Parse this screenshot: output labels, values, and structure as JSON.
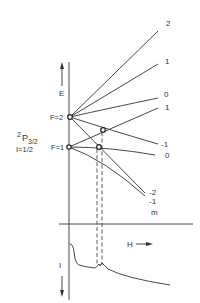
{
  "diagram": {
    "energy_axis_label": "E",
    "field_axis_label": "H",
    "intensity_axis_label": "I",
    "state_label_main": "2",
    "state_label_P": "P",
    "state_label_sub": "3/2",
    "nuclear_spin_label": "I=1/2",
    "levels": [
      {
        "label": "F=2",
        "id": "F2"
      },
      {
        "label": "F=1",
        "id": "F1"
      }
    ],
    "branch_labels": [
      "2",
      "1",
      "0",
      "1",
      "-1",
      "0",
      "-2",
      "-1"
    ],
    "m_label": "m"
  }
}
